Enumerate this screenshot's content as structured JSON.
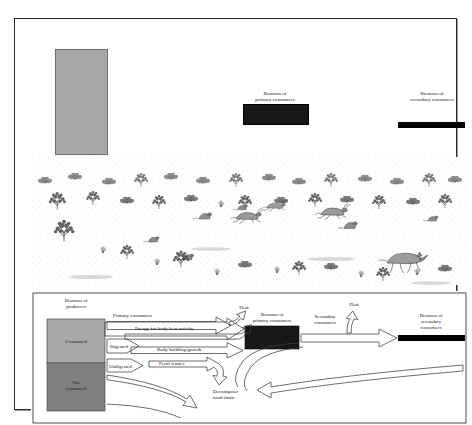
{
  "figure": {
    "border_color": "#2b2b2b"
  },
  "pyramid": {
    "producers": {
      "label": "Biomass of\nproducers",
      "color": "#a8a8a8",
      "relative_size": "largest"
    },
    "primary_consumers": {
      "label": "Biomass of\nprimary consumers",
      "color": "#181818",
      "relative_size": "medium"
    },
    "secondary_consumers": {
      "label": "Biomass of\nsecondary consumers",
      "color": "#000000",
      "relative_size": "smallest"
    }
  },
  "scene": {
    "caption": "pen-and-ink grassland scene with shrubs, ground squirrels, jackrabbit and coyote",
    "organisms": [
      "shrub",
      "bunchgrass",
      "ground-squirrel",
      "jackrabbit",
      "coyote"
    ]
  },
  "flow": {
    "producers": {
      "title": "Biomass of\nproducers",
      "consumed": "Consumed",
      "not_consumed": "Not\nconsumed",
      "consumed_color": "#a8a8a8",
      "not_consumed_color": "#808080"
    },
    "primary_consumers_box": {
      "title": "Biomass of\nprimary consumers",
      "color": "#181818"
    },
    "secondary_consumers_box": {
      "title": "Biomass of\nsecondary consumers",
      "color": "#000000"
    },
    "arrows": {
      "primary_consumers": "Primary consumers",
      "secondary_consumers": "Secondary\nconsumers",
      "digested": "Digested",
      "undigested": "Undigested",
      "energy_heat": "Energy for body heat activity",
      "body_growth": "Body building/growth",
      "fecal_wastes": "Fecal wastes",
      "heat_left": "Heat",
      "heat_right": "Heat",
      "decomposer": "Decomposer\nfood chain"
    }
  }
}
